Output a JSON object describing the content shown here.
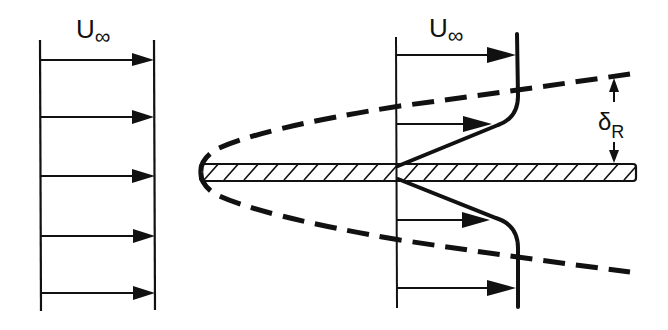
{
  "figure": {
    "colors": {
      "ink": "#111111",
      "background": "#ffffff"
    }
  },
  "left_profile": {
    "label_main": "U",
    "label_sub": "∞",
    "arrow_count": 5
  },
  "right_profile": {
    "label_main": "U",
    "label_sub": "∞",
    "arrow_count": 5
  },
  "plate": {
    "name": "flat plate (hatched)"
  },
  "boundary_layer_edge": {
    "style": "dashed"
  },
  "thickness_annotation": {
    "label_main": "δ",
    "label_sub": "R"
  }
}
